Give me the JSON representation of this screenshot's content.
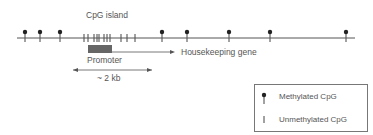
{
  "title_label": "CpG island",
  "gene_label": "Housekeeping gene",
  "promoter_label": "Promoter",
  "length_label": "~ 2 kb",
  "colors": {
    "line": "#555555",
    "promoter": "#666666",
    "text": "#555555"
  },
  "dna": {
    "x1": 17,
    "x2": 355,
    "y": 38
  },
  "methylated_positions": [
    25,
    40,
    60,
    162,
    187,
    229,
    270,
    346
  ],
  "unmethylated_positions": [
    84,
    88,
    94,
    97,
    99,
    104,
    107,
    110,
    121,
    127,
    135
  ],
  "legend": {
    "methylated": "Methylated CpG",
    "unmethylated": "Unmethylated CpG"
  }
}
